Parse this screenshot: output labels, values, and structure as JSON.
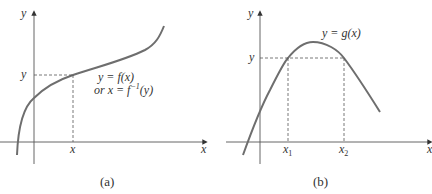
{
  "panels": [
    {
      "id": "a",
      "caption": "(a)",
      "axis_labels": {
        "x": "x",
        "y": "y"
      },
      "tick_labels": {
        "x": "x",
        "y": "y"
      },
      "curve_label_line1": "y = f(x)",
      "curve_label_line2_prefix": "or x = f",
      "curve_label_line2_sup": "−1",
      "curve_label_line2_suffix": "(y)",
      "description": "Monotonically increasing curve; horizontal line at y meets curve once at x"
    },
    {
      "id": "b",
      "caption": "(b)",
      "axis_labels": {
        "x": "x",
        "y": "y"
      },
      "tick_labels": {
        "y": "y",
        "x1": "x",
        "x1_sub": "1",
        "x2": "x",
        "x2_sub": "2"
      },
      "curve_label": "y = g(x)",
      "description": "Curve with a maximum; horizontal line at y meets curve at two points x1 and x2"
    }
  ],
  "colors": {
    "curve": "#6e6e6e",
    "axis": "#555555",
    "dashed": "#555555",
    "text": "#333333"
  }
}
